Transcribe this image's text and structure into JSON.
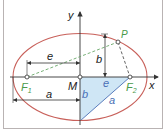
{
  "diagram": {
    "labels": {
      "x_axis": "x",
      "y_axis": "y",
      "center": "M",
      "focus1": "F",
      "focus1_sub": "1",
      "focus2": "F",
      "focus2_sub": "2",
      "point": "P",
      "dim_e": "e",
      "dim_a": "a",
      "dim_b": "b",
      "tri_b": "b",
      "tri_e": "e",
      "tri_a": "a"
    },
    "colors": {
      "ellipse": "#c8605a",
      "axes": "#333333",
      "focus_label": "#4a9a4a",
      "dashed": "#6aa86a",
      "triangle_fill": "#cfe6f5",
      "triangle_label": "#4a6fb5",
      "text": "#222222"
    }
  }
}
